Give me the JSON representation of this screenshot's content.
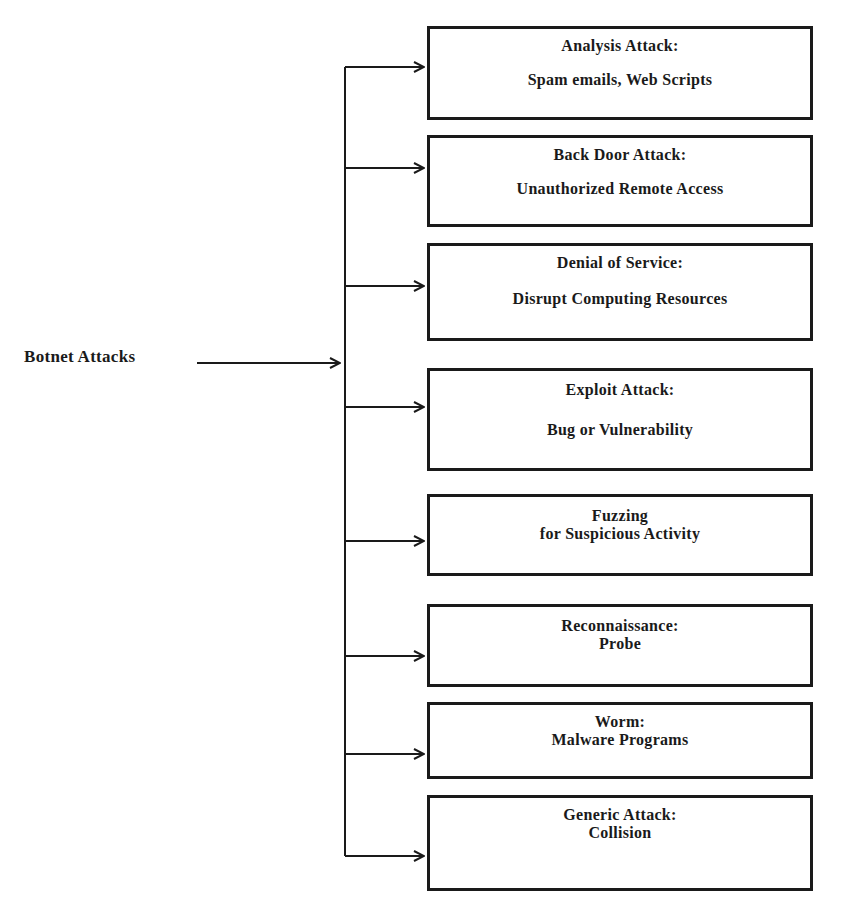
{
  "root": {
    "label": "Botnet Attacks"
  },
  "colors": {
    "line": "#1a1a1a",
    "background": "#ffffff"
  },
  "nodes": [
    {
      "title": "Analysis Attack:",
      "subtitle": "Spam emails, Web Scripts"
    },
    {
      "title": "Back Door Attack:",
      "subtitle": "Unauthorized Remote Access"
    },
    {
      "title": "Denial of Service:",
      "subtitle": "Disrupt Computing Resources"
    },
    {
      "title": "Exploit Attack:",
      "subtitle": "Bug or Vulnerability"
    },
    {
      "title": "Fuzzing",
      "subtitle": "for Suspicious Activity"
    },
    {
      "title": "Reconnaissance:",
      "subtitle": "Probe"
    },
    {
      "title": "Worm:",
      "subtitle": "Malware Programs"
    },
    {
      "title": "Generic Attack:",
      "subtitle": "Collision"
    }
  ]
}
